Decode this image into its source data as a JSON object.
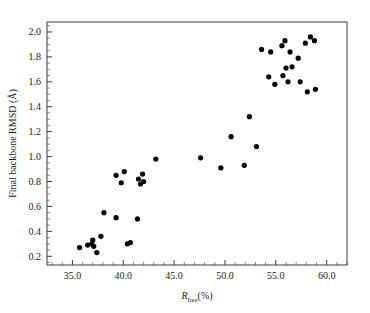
{
  "chart_data": {
    "type": "scatter",
    "title": "",
    "xlabel": "R_free(%)",
    "xlabel_base": "R",
    "xlabel_sub": "free",
    "xlabel_suffix": "(%)",
    "ylabel": "Final backbone RMSD (Å)",
    "xlim": [
      32.5,
      62.0
    ],
    "ylim": [
      0.13,
      2.08
    ],
    "xticks": [
      35.0,
      40.0,
      45.0,
      50.0,
      55.0,
      60.0
    ],
    "xtick_labels": [
      "35.0",
      "40.0",
      "45.0",
      "50.0",
      "55.0",
      "60.0"
    ],
    "yticks": [
      0.2,
      0.4,
      0.6,
      0.8,
      1.0,
      1.2,
      1.4,
      1.6,
      1.8,
      2.0
    ],
    "ytick_labels": [
      "0.2",
      "0.4",
      "0.6",
      "0.8",
      "1.0",
      "1.2",
      "1.4",
      "1.6",
      "1.8",
      "2.0"
    ],
    "xminor_step": 1.0,
    "yminor_step": 0.1,
    "grid": false,
    "legend": null,
    "marker": "circle",
    "marker_color": "#000000",
    "marker_size": 5.2,
    "points": [
      {
        "x": 35.7,
        "y": 0.27
      },
      {
        "x": 36.5,
        "y": 0.29
      },
      {
        "x": 36.9,
        "y": 0.3
      },
      {
        "x": 37.1,
        "y": 0.28
      },
      {
        "x": 37.0,
        "y": 0.33
      },
      {
        "x": 37.4,
        "y": 0.23
      },
      {
        "x": 37.8,
        "y": 0.36
      },
      {
        "x": 38.1,
        "y": 0.55
      },
      {
        "x": 39.3,
        "y": 0.51
      },
      {
        "x": 40.4,
        "y": 0.3
      },
      {
        "x": 40.7,
        "y": 0.31
      },
      {
        "x": 41.4,
        "y": 0.5
      },
      {
        "x": 39.3,
        "y": 0.85
      },
      {
        "x": 39.8,
        "y": 0.79
      },
      {
        "x": 40.1,
        "y": 0.88
      },
      {
        "x": 41.5,
        "y": 0.82
      },
      {
        "x": 41.7,
        "y": 0.78
      },
      {
        "x": 41.9,
        "y": 0.86
      },
      {
        "x": 42.0,
        "y": 0.8
      },
      {
        "x": 43.2,
        "y": 0.98
      },
      {
        "x": 47.6,
        "y": 0.99
      },
      {
        "x": 49.6,
        "y": 0.91
      },
      {
        "x": 50.6,
        "y": 1.16
      },
      {
        "x": 51.9,
        "y": 0.93
      },
      {
        "x": 52.4,
        "y": 1.32
      },
      {
        "x": 53.1,
        "y": 1.08
      },
      {
        "x": 53.6,
        "y": 1.86
      },
      {
        "x": 54.3,
        "y": 1.64
      },
      {
        "x": 54.5,
        "y": 1.84
      },
      {
        "x": 54.9,
        "y": 1.58
      },
      {
        "x": 55.6,
        "y": 1.89
      },
      {
        "x": 55.7,
        "y": 1.65
      },
      {
        "x": 55.9,
        "y": 1.93
      },
      {
        "x": 56.0,
        "y": 1.71
      },
      {
        "x": 56.2,
        "y": 1.6
      },
      {
        "x": 56.4,
        "y": 1.84
      },
      {
        "x": 56.6,
        "y": 1.72
      },
      {
        "x": 57.2,
        "y": 1.79
      },
      {
        "x": 57.4,
        "y": 1.6
      },
      {
        "x": 57.9,
        "y": 1.91
      },
      {
        "x": 58.1,
        "y": 1.52
      },
      {
        "x": 58.4,
        "y": 1.96
      },
      {
        "x": 58.8,
        "y": 1.93
      },
      {
        "x": 58.9,
        "y": 1.54
      }
    ]
  }
}
